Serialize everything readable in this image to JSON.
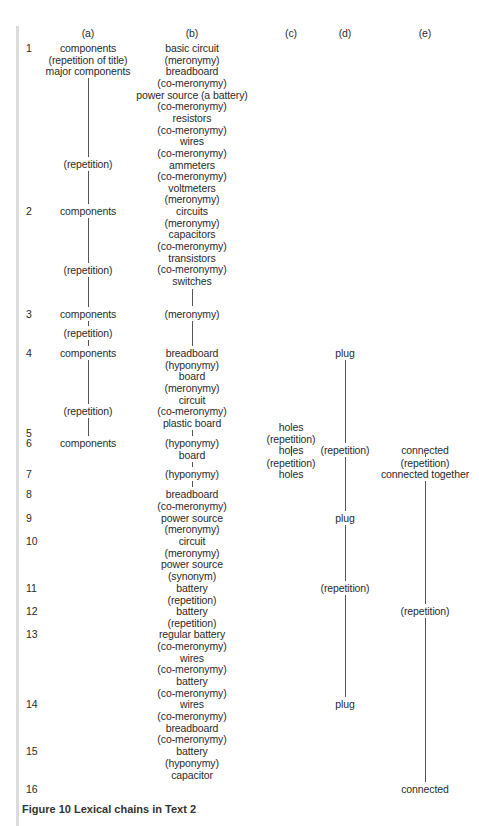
{
  "figure": {
    "caption": "Figure 10 Lexical chains in Text 2",
    "column_headers": [
      {
        "label": "(a)",
        "x": 88
      },
      {
        "label": "(b)",
        "x": 192
      },
      {
        "label": "(c)",
        "x": 291
      },
      {
        "label": "(d)",
        "x": 345
      },
      {
        "label": "(e)",
        "x": 425
      }
    ],
    "header_y": 27,
    "row_numbers": [
      {
        "label": "1",
        "y": 42
      },
      {
        "label": "2",
        "y": 205
      },
      {
        "label": "3",
        "y": 308
      },
      {
        "label": "4",
        "y": 347
      },
      {
        "label": "5",
        "y": 427
      },
      {
        "label": "6",
        "y": 437
      },
      {
        "label": "7",
        "y": 468
      },
      {
        "label": "8",
        "y": 488
      },
      {
        "label": "9",
        "y": 512
      },
      {
        "label": "10",
        "y": 535
      },
      {
        "label": "11",
        "y": 582
      },
      {
        "label": "12",
        "y": 605
      },
      {
        "label": "13",
        "y": 628
      },
      {
        "label": "14",
        "y": 698
      },
      {
        "label": "15",
        "y": 745
      },
      {
        "label": "16",
        "y": 783
      }
    ],
    "column_a": [
      {
        "text": "components",
        "y": 42
      },
      {
        "text": "(repetition of title)",
        "y": 54
      },
      {
        "text": "major components",
        "y": 65
      },
      {
        "text": "(repetition)",
        "y": 158
      },
      {
        "text": "components",
        "y": 205
      },
      {
        "text": "(repetition)",
        "y": 264
      },
      {
        "text": "components",
        "y": 308
      },
      {
        "text": "(repetition)",
        "y": 327
      },
      {
        "text": "components",
        "y": 347
      },
      {
        "text": "(repetition)",
        "y": 405
      },
      {
        "text": "components",
        "y": 437
      }
    ],
    "column_b": [
      {
        "text": "basic circuit",
        "y": 42
      },
      {
        "text": "(meronymy)",
        "y": 54
      },
      {
        "text": "breadboard",
        "y": 65
      },
      {
        "text": "(co-meronymy)",
        "y": 77
      },
      {
        "text": "power source (a battery)",
        "y": 89
      },
      {
        "text": "(co-meronymy)",
        "y": 100
      },
      {
        "text": "resistors",
        "y": 112
      },
      {
        "text": "(co-meronymy)",
        "y": 124
      },
      {
        "text": "wires",
        "y": 135
      },
      {
        "text": "(co-meronymy)",
        "y": 147
      },
      {
        "text": "ammeters",
        "y": 159
      },
      {
        "text": "(co-meronymy)",
        "y": 170
      },
      {
        "text": "voltmeters",
        "y": 182
      },
      {
        "text": "(meronymy)",
        "y": 193
      },
      {
        "text": "circuits",
        "y": 205
      },
      {
        "text": "(meronymy)",
        "y": 217
      },
      {
        "text": "capacitors",
        "y": 228
      },
      {
        "text": "(co-meronymy)",
        "y": 240
      },
      {
        "text": "transistors",
        "y": 252
      },
      {
        "text": "(co-meronymy)",
        "y": 263
      },
      {
        "text": "switches",
        "y": 275
      },
      {
        "text": "(meronymy)",
        "y": 308
      },
      {
        "text": "breadboard",
        "y": 347
      },
      {
        "text": "(hyponymy)",
        "y": 359
      },
      {
        "text": "board",
        "y": 370
      },
      {
        "text": "(meronymy)",
        "y": 382
      },
      {
        "text": "circuit",
        "y": 394
      },
      {
        "text": "(co-meronymy)",
        "y": 405
      },
      {
        "text": "plastic board",
        "y": 417
      },
      {
        "text": "(hyponymy)",
        "y": 437
      },
      {
        "text": "board",
        "y": 449
      },
      {
        "text": "(hyponymy)",
        "y": 468
      },
      {
        "text": "breadboard",
        "y": 488
      },
      {
        "text": "(co-meronymy)",
        "y": 500
      },
      {
        "text": "power source",
        "y": 512
      },
      {
        "text": "(meronymy)",
        "y": 523
      },
      {
        "text": "circuit",
        "y": 535
      },
      {
        "text": "(meronymy)",
        "y": 547
      },
      {
        "text": "power source",
        "y": 558
      },
      {
        "text": "(synonym)",
        "y": 570
      },
      {
        "text": "battery",
        "y": 582
      },
      {
        "text": "(repetition)",
        "y": 594
      },
      {
        "text": "battery",
        "y": 605
      },
      {
        "text": "(repetition)",
        "y": 617
      },
      {
        "text": "regular battery",
        "y": 628
      },
      {
        "text": "(co-meronymy)",
        "y": 640
      },
      {
        "text": "wires",
        "y": 652
      },
      {
        "text": "(co-meronymy)",
        "y": 663
      },
      {
        "text": "battery",
        "y": 675
      },
      {
        "text": "(co-meronymy)",
        "y": 687
      },
      {
        "text": "wires",
        "y": 698
      },
      {
        "text": "(co-meronymy)",
        "y": 710
      },
      {
        "text": "breadboard",
        "y": 722
      },
      {
        "text": "(co-meronymy)",
        "y": 733
      },
      {
        "text": "battery",
        "y": 745
      },
      {
        "text": "(hyponymy)",
        "y": 757
      },
      {
        "text": "capacitor",
        "y": 769
      }
    ],
    "column_c": [
      {
        "text": "holes",
        "y": 421
      },
      {
        "text": "(repetition)",
        "y": 433
      },
      {
        "text": "holes",
        "y": 444
      },
      {
        "text": "(repetition)",
        "y": 457
      },
      {
        "text": "holes",
        "y": 468
      }
    ],
    "column_d": [
      {
        "text": "plug",
        "y": 347
      },
      {
        "text": "(repetition)",
        "y": 444
      },
      {
        "text": "plug",
        "y": 512
      },
      {
        "text": "(repetition)",
        "y": 582
      },
      {
        "text": "plug",
        "y": 698
      }
    ],
    "column_e": [
      {
        "text": "connected",
        "y": 444
      },
      {
        "text": "(repetition)",
        "y": 457
      },
      {
        "text": "connected together",
        "y": 468
      },
      {
        "text": "(repetition)",
        "y": 605
      },
      {
        "text": "connected",
        "y": 783
      }
    ],
    "connector_lines": [
      {
        "col": "a",
        "x": 88,
        "top": 78,
        "bottom": 157
      },
      {
        "col": "a",
        "x": 88,
        "top": 171,
        "bottom": 204
      },
      {
        "col": "a",
        "x": 88,
        "top": 218,
        "bottom": 263
      },
      {
        "col": "a",
        "x": 88,
        "top": 277,
        "bottom": 307
      },
      {
        "col": "a",
        "x": 88,
        "top": 321,
        "bottom": 326
      },
      {
        "col": "a",
        "x": 88,
        "top": 340,
        "bottom": 346
      },
      {
        "col": "a",
        "x": 88,
        "top": 360,
        "bottom": 404
      },
      {
        "col": "a",
        "x": 88,
        "top": 418,
        "bottom": 436
      },
      {
        "col": "b",
        "x": 192,
        "top": 289,
        "bottom": 306
      },
      {
        "col": "b",
        "x": 192,
        "top": 321,
        "bottom": 346
      },
      {
        "col": "b",
        "x": 192,
        "top": 430,
        "bottom": 436
      },
      {
        "col": "b",
        "x": 192,
        "top": 462,
        "bottom": 467
      },
      {
        "col": "b",
        "x": 192,
        "top": 481,
        "bottom": 487
      },
      {
        "col": "c",
        "x": 291,
        "top": 446,
        "bottom": 456
      },
      {
        "col": "d",
        "x": 345,
        "top": 360,
        "bottom": 443
      },
      {
        "col": "d",
        "x": 345,
        "top": 457,
        "bottom": 511
      },
      {
        "col": "d",
        "x": 345,
        "top": 525,
        "bottom": 581
      },
      {
        "col": "d",
        "x": 345,
        "top": 595,
        "bottom": 697
      },
      {
        "col": "e",
        "x": 425,
        "top": 454,
        "bottom": 457
      },
      {
        "col": "e",
        "x": 425,
        "top": 481,
        "bottom": 604
      },
      {
        "col": "e",
        "x": 425,
        "top": 618,
        "bottom": 782
      }
    ]
  }
}
